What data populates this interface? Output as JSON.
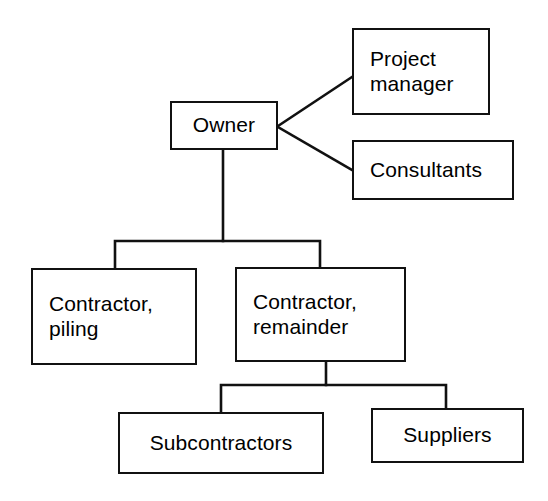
{
  "diagram": {
    "type": "organizational-chart",
    "background_color": "#ffffff",
    "line_color": "#111111",
    "text_color": "#000000",
    "nodes": [
      {
        "id": "owner",
        "label": "Owner",
        "x": 170,
        "y": 101,
        "w": 108,
        "h": 49,
        "align": "center"
      },
      {
        "id": "project-manager",
        "label": "Project\nmanager",
        "x": 352,
        "y": 28,
        "w": 138,
        "h": 87,
        "align": "left"
      },
      {
        "id": "consultants",
        "label": "Consultants",
        "x": 352,
        "y": 140,
        "w": 162,
        "h": 60,
        "align": "left"
      },
      {
        "id": "contractor-piling",
        "label": "Contractor,\npiling",
        "x": 31,
        "y": 268,
        "w": 166,
        "h": 97,
        "align": "left"
      },
      {
        "id": "contractor-remainder",
        "label": "Contractor,\nremainder",
        "x": 235,
        "y": 267,
        "w": 171,
        "h": 95,
        "align": "left"
      },
      {
        "id": "subcontractors",
        "label": "Subcontractors",
        "x": 118,
        "y": 412,
        "w": 206,
        "h": 62,
        "align": "center"
      },
      {
        "id": "suppliers",
        "label": "Suppliers",
        "x": 371,
        "y": 408,
        "w": 153,
        "h": 55,
        "align": "center"
      }
    ],
    "edges": [
      {
        "id": "owner-to-project-manager",
        "from": "owner",
        "to": "project-manager",
        "style": "diagonal",
        "points": "278,126 352,77"
      },
      {
        "id": "owner-to-consultants",
        "from": "owner",
        "to": "consultants",
        "style": "diagonal",
        "points": "278,127 352,170"
      },
      {
        "id": "owner-to-contractors-bus",
        "from": "owner",
        "to": "contractor-piling, contractor-remainder",
        "style": "orthogonal",
        "points": "223,150 223,241 115,241 115,268"
      },
      {
        "id": "owner-bus-to-contractor-remainder",
        "from": "owner",
        "to": "contractor-remainder",
        "style": "orthogonal",
        "points": "223,241 320,241 320,267"
      },
      {
        "id": "contractor-remainder-to-subcontractors",
        "from": "contractor-remainder",
        "to": "subcontractors",
        "style": "orthogonal",
        "points": "326,362 326,385 221,385 221,412"
      },
      {
        "id": "contractor-remainder-to-suppliers",
        "from": "contractor-remainder",
        "to": "suppliers",
        "style": "orthogonal",
        "points": "326,385 446,385 446,408"
      }
    ]
  }
}
